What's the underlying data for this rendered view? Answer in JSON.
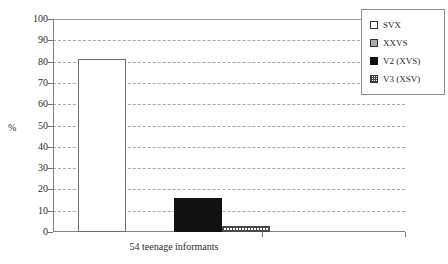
{
  "chart_data": {
    "type": "bar",
    "title": "",
    "subtitle": "",
    "xlabel": "54 teenage informants",
    "ylabel": "%",
    "ylim": [
      0,
      100
    ],
    "ytick_step": 10,
    "grid": true,
    "legend_position": "top-right",
    "categories": [
      "54 teenage informants"
    ],
    "ytick_labels": [
      "100",
      "90",
      "80",
      "70",
      "60",
      "50",
      "40",
      "30",
      "20",
      "10",
      "0"
    ],
    "ytick_values": [
      100,
      90,
      80,
      70,
      60,
      50,
      40,
      30,
      20,
      10,
      0
    ],
    "series": [
      {
        "name": "SVX",
        "values": [
          81
        ],
        "swatch": "open",
        "color": "#ffffff"
      },
      {
        "name": "XXVS",
        "values": [
          0
        ],
        "swatch": "gray",
        "color": "#a9a9a9"
      },
      {
        "name": "V2 (XVS)",
        "values": [
          16
        ],
        "swatch": "solid-black",
        "color": "#111111"
      },
      {
        "name": "V3 (XSV)",
        "values": [
          3
        ],
        "swatch": "crosshatch",
        "color": "#ffffff"
      }
    ]
  },
  "legend": {
    "items": [
      {
        "label": "SVX"
      },
      {
        "label": "XXVS"
      },
      {
        "label": "V2 (XVS)"
      },
      {
        "label": "V3 (XSV)"
      }
    ]
  },
  "axes": {
    "y_title": "%",
    "x_title": "54 teenage informants"
  }
}
